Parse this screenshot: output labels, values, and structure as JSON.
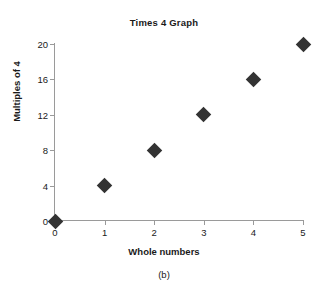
{
  "chart_data": {
    "type": "scatter",
    "title": "Times 4 Graph",
    "xlabel": "Whole numbers",
    "ylabel": "Multiples of 4",
    "caption": "(b)",
    "x": [
      0,
      1,
      2,
      3,
      4,
      5
    ],
    "values": [
      0,
      4,
      8,
      12,
      16,
      20
    ],
    "xticks": [
      "0",
      "1",
      "2",
      "3",
      "4",
      "5"
    ],
    "yticks": [
      "0",
      "4",
      "8",
      "12",
      "16",
      "20"
    ],
    "xlim": [
      0,
      5
    ],
    "ylim": [
      0,
      20
    ],
    "grid": false,
    "legend": false,
    "marker": "diamond",
    "marker_color": "#333333",
    "axis_color": "#9a9a9a",
    "background": "#ffffff"
  }
}
